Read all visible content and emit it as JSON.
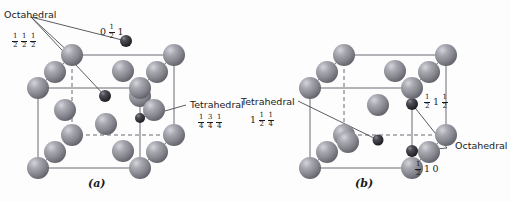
{
  "figure": {
    "background_color": "#fdfdfd",
    "panels": [
      {
        "id": "a",
        "caption": "(a)",
        "description": "FCC unit cell showing octahedral interstitial sites"
      },
      {
        "id": "b",
        "caption": "(b)",
        "description": "FCC unit cell showing tetrahedral interstitial sites"
      }
    ]
  },
  "colors": {
    "host_sphere_base": "#8e8e96",
    "host_sphere_light": "#c9c9d0",
    "host_sphere_dark": "#5e5e66",
    "interstitial_sphere_base": "#3a3a40",
    "interstitial_sphere_light": "#7a7a82",
    "interstitial_sphere_dark": "#1a1a1e",
    "edge_solid": "#6b6b73",
    "edge_dashed": "#6b6b73",
    "leader_line": "#4a4a52",
    "text": "#1a1a1a"
  },
  "panel_a": {
    "caption": "(a)",
    "labels": {
      "octahedral": "Octahedral",
      "octahedral_coord": {
        "x": "0",
        "y_num": "1",
        "y_den": "2",
        "z": "1"
      },
      "body_center_coord": {
        "a_num": "1",
        "a_den": "2",
        "b_num": "1",
        "b_den": "2",
        "c_num": "1",
        "c_den": "2"
      },
      "tetrahedral": "Tetrahedral",
      "tetrahedral_coord": {
        "a_num": "1",
        "a_den": "4",
        "b_num": "3",
        "b_den": "4",
        "c_num": "1",
        "c_den": "4"
      }
    }
  },
  "panel_b": {
    "caption": "(b)",
    "labels": {
      "tetrahedral": "Tetrahedral",
      "tetrahedral_coord": {
        "whole": "1",
        "b_num": "1",
        "b_den": "2",
        "c_num": "1",
        "c_den": "4"
      },
      "octahedral": "Octahedral",
      "octahedral_coord_upper": {
        "a_num": "1",
        "a_den": "2",
        "whole": "1",
        "c_num": "1",
        "c_den": "2"
      },
      "octahedral_coord_lower": {
        "a_num": "1",
        "a_den": "2",
        "whole_b": "1",
        "whole_c": "0"
      }
    }
  },
  "icons": {
    "host_atom": "large-gray-sphere",
    "interstitial_atom": "small-dark-sphere",
    "leader": "leader-line",
    "cube_edge": "solid-edge",
    "hidden_edge": "dashed-edge"
  }
}
